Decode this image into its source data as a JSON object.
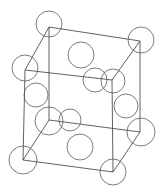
{
  "diagram": {
    "type": "crystal-unit-cell",
    "colors": {
      "edge": "#3a3a3a",
      "atom": "#5a5a5a",
      "background": "#ffffff"
    },
    "vertices": {
      "top_back_left": [
        49,
        27
      ],
      "top_back_right": [
        140,
        41
      ],
      "bottom_back_right": [
        140,
        132
      ],
      "bottom_back_left": [
        49,
        120
      ],
      "top_front_left": [
        25,
        70
      ],
      "top_front_right": [
        112,
        80
      ],
      "bottom_front_right": [
        113,
        172
      ],
      "bottom_front_left": [
        23,
        160
      ]
    },
    "edges": [
      [
        "top_back_left",
        "top_back_right"
      ],
      [
        "top_back_right",
        "bottom_back_right"
      ],
      [
        "bottom_back_right",
        "bottom_back_left"
      ],
      [
        "bottom_back_left",
        "top_back_left"
      ],
      [
        "top_front_left",
        "top_front_right"
      ],
      [
        "top_front_right",
        "bottom_front_right"
      ],
      [
        "bottom_front_right",
        "bottom_front_left"
      ],
      [
        "bottom_front_left",
        "top_front_left"
      ],
      [
        "top_back_left",
        "top_front_left"
      ],
      [
        "top_back_right",
        "top_front_right"
      ],
      [
        "bottom_back_right",
        "bottom_front_right"
      ],
      [
        "bottom_back_left",
        "bottom_front_left"
      ]
    ],
    "atoms": [
      {
        "name": "corner-top-back-left",
        "cx": 49,
        "cy": 24,
        "r": 13
      },
      {
        "name": "corner-top-back-right",
        "cx": 141,
        "cy": 40,
        "r": 13
      },
      {
        "name": "corner-top-front-left",
        "cx": 25,
        "cy": 68,
        "r": 13
      },
      {
        "name": "corner-top-front-right",
        "cx": 113,
        "cy": 81,
        "r": 12
      },
      {
        "name": "corner-bottom-back-left",
        "cx": 49,
        "cy": 121,
        "r": 14
      },
      {
        "name": "corner-bottom-back-right",
        "cx": 141,
        "cy": 132,
        "r": 14
      },
      {
        "name": "corner-bottom-front-left",
        "cx": 23,
        "cy": 160,
        "r": 14
      },
      {
        "name": "corner-bottom-front-right",
        "cx": 113,
        "cy": 172,
        "r": 13
      },
      {
        "name": "face-top",
        "cx": 81,
        "cy": 55,
        "r": 13
      },
      {
        "name": "face-front-top-edge",
        "cx": 95,
        "cy": 80,
        "r": 12
      },
      {
        "name": "face-left",
        "cx": 36,
        "cy": 95,
        "r": 12
      },
      {
        "name": "face-right",
        "cx": 126,
        "cy": 106,
        "r": 12
      },
      {
        "name": "face-back-lower",
        "cx": 70,
        "cy": 120,
        "r": 11
      },
      {
        "name": "face-bottom",
        "cx": 80,
        "cy": 147,
        "r": 13
      }
    ]
  }
}
